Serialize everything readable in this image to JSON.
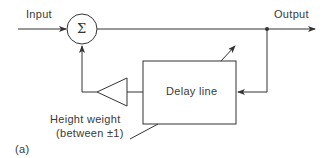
{
  "diagram": {
    "labels": {
      "input": "Input",
      "output": "Output",
      "sum": "Σ",
      "delay_line": "Delay line",
      "weight_line1": "Height weight",
      "weight_line2": "(between ±1)",
      "panel": "(a)"
    },
    "colors": {
      "stroke": "#333333",
      "text": "#3a3a3a"
    }
  }
}
